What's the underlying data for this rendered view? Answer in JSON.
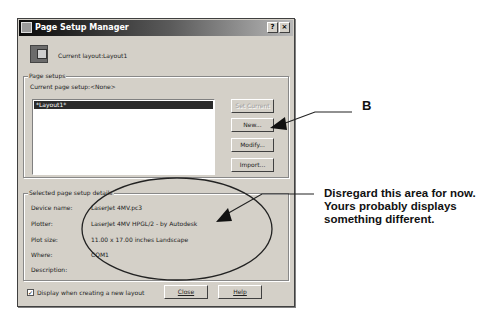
{
  "dialog": {
    "title": "Page Setup Manager",
    "title_buttons": {
      "help": "?",
      "close": "×"
    },
    "current_layout_label": "Current layout:",
    "current_layout_value": "Layout1",
    "page_setups": {
      "group_title": "Page setups",
      "current_page_setup_label": "Current page setup:",
      "current_page_setup_value": "<None>",
      "list_items": [
        "*Layout1*"
      ],
      "buttons": {
        "set_current": "Set Current",
        "new": "New...",
        "modify": "Modify...",
        "import": "Import..."
      }
    },
    "details": {
      "group_title": "Selected page setup details",
      "rows": [
        {
          "label": "Device name:",
          "value": "LaserJet 4MV.pc3"
        },
        {
          "label": "Plotter:",
          "value": "LaserJet 4MV HPGL/2 - by Autodesk"
        },
        {
          "label": "Plot size:",
          "value": "11.00 x 17.00 inches Landscape"
        },
        {
          "label": "Where:",
          "value": "COM1"
        },
        {
          "label": "Description:",
          "value": ""
        }
      ]
    },
    "checkbox": {
      "label": "Display when creating a new layout",
      "checked": true,
      "mark": "✓"
    },
    "footer_buttons": {
      "close": "Close",
      "help": "Help"
    }
  },
  "annotations": {
    "b_label": "B",
    "note": "Disregard this area for now.  Yours probably displays something different."
  }
}
